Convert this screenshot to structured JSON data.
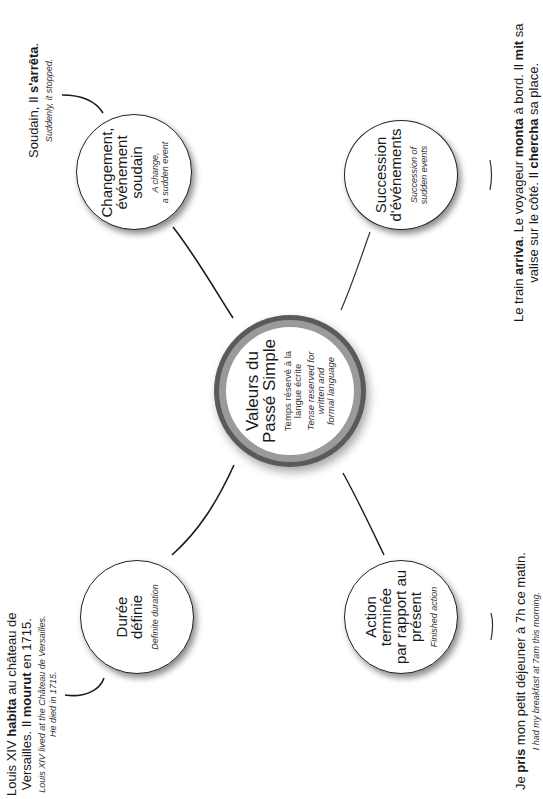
{
  "center": {
    "title_line1": "Valeurs du",
    "title_line2": "Passé Simple",
    "sub_fr_line1": "Temps réservé à la",
    "sub_fr_line2": "langue écrite",
    "sub_en_line1": "Tense reserved for",
    "sub_en_line2": "written and",
    "sub_en_line3": "formal language",
    "ring_inner_color": "#9a9a9a",
    "ring_outer_color": "#5a5a5a"
  },
  "nodes": {
    "changement": {
      "title_line1": "Changement,",
      "title_line2": "événement",
      "title_line3": "soudain",
      "sub_line1": "A change,",
      "sub_line2": "a sudden event"
    },
    "succession": {
      "title_line1": "Succession",
      "title_line2": "d'événements",
      "sub_line1": "Succession of",
      "sub_line2": "sudden events"
    },
    "duree": {
      "title_line1": "Durée",
      "title_line2": "définie",
      "sub_line1": "Definite duration"
    },
    "action": {
      "title_line1": "Action",
      "title_line2": "terminée",
      "title_line3": "par rapport au",
      "title_line4": "présent",
      "sub_line1": "Finished action"
    }
  },
  "examples": {
    "changement": {
      "fr_pre": "Soudain, Il ",
      "fr_bold": "s'arrêta",
      "fr_post": ".",
      "en": "Suddenly, it stopped."
    },
    "succession": {
      "l1_pre": "Le train ",
      "l1_b1": "arriva",
      "l1_mid": ". Le voyageur ",
      "l1_b2": "monta",
      "l1_mid2": " à bord. Il ",
      "l1_b3": "mit",
      "l1_post": " sa",
      "l2_pre": "valise sur le côté. Il ",
      "l2_b1": "chercha",
      "l2_post": " sa place."
    },
    "duree": {
      "l1_pre": "Louis XIV ",
      "l1_b1": "habita",
      "l1_post": " au château de",
      "l2_pre": "Versailles. Il ",
      "l2_b1": "mourut",
      "l2_post": " en 1715.",
      "en_line1": "Louis XIV lived at the Château de Versailles.",
      "en_line2": "He died in 1715."
    },
    "action": {
      "fr_pre": "Je ",
      "fr_bold": "pris",
      "fr_post": " mon petit déjeuner à 7h ce matin.",
      "en": "I had my breakfast at 7am this morning."
    }
  }
}
